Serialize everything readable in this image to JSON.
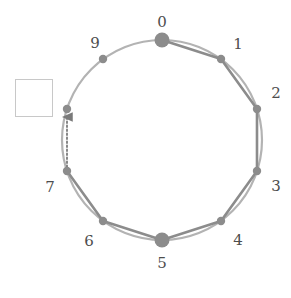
{
  "figure": {
    "kind": "cycle-graph-diagram",
    "width": 291,
    "height": 298,
    "background": "#ffffff"
  },
  "colors": {
    "circle_arc": "#b3b3b3",
    "polygon_edge": "#8c8c8c",
    "node_fill": "#8c8c8c",
    "label_text": "#4d4d4d",
    "box_border": "#c8c8c8",
    "box_fill": "#ffffff",
    "dotted_arrow": "#7a7a7a"
  },
  "circle": {
    "cx": 162,
    "cy": 140,
    "r": 100,
    "stroke_width": 2.2
  },
  "nodes": [
    {
      "id": "0",
      "label": "0",
      "angle_deg": -90,
      "x": 162,
      "y": 40,
      "radius": 7.5,
      "shape": "circle",
      "big": true,
      "label_x": 162,
      "label_y": 22,
      "label_anchor": "middle"
    },
    {
      "id": "1",
      "label": "1",
      "angle_deg": -54,
      "x": 221,
      "y": 59,
      "radius": 4.2,
      "shape": "circle",
      "big": false,
      "label_x": 238,
      "label_y": 44,
      "label_anchor": "middle"
    },
    {
      "id": "2",
      "label": "2",
      "angle_deg": -18,
      "x": 257,
      "y": 109,
      "radius": 4.2,
      "shape": "circle",
      "big": false,
      "label_x": 276,
      "label_y": 93,
      "label_anchor": "middle"
    },
    {
      "id": "3",
      "label": "3",
      "angle_deg": 18,
      "x": 257,
      "y": 171,
      "radius": 4.2,
      "shape": "circle",
      "big": false,
      "label_x": 276,
      "label_y": 186,
      "label_anchor": "middle"
    },
    {
      "id": "4",
      "label": "4",
      "angle_deg": 54,
      "x": 221,
      "y": 221,
      "radius": 4.2,
      "shape": "circle",
      "big": false,
      "label_x": 238,
      "label_y": 240,
      "label_anchor": "middle"
    },
    {
      "id": "5",
      "label": "5",
      "angle_deg": 90,
      "x": 162,
      "y": 240,
      "radius": 7.5,
      "shape": "circle",
      "big": true,
      "label_x": 162,
      "label_y": 263,
      "label_anchor": "middle"
    },
    {
      "id": "6",
      "label": "6",
      "angle_deg": 126,
      "x": 103,
      "y": 221,
      "radius": 4.2,
      "shape": "circle",
      "big": false,
      "label_x": 89,
      "label_y": 241,
      "label_anchor": "middle"
    },
    {
      "id": "7",
      "label": "7",
      "angle_deg": 162,
      "x": 67,
      "y": 171,
      "radius": 4.2,
      "shape": "circle",
      "big": false,
      "label_x": 50,
      "label_y": 187,
      "label_anchor": "middle"
    },
    {
      "id": "8",
      "label": "",
      "angle_deg": 198,
      "x": 67,
      "y": 109,
      "radius": 4.2,
      "shape": "circle",
      "big": false,
      "label_x": null,
      "label_y": null,
      "label_anchor": "middle"
    },
    {
      "id": "9",
      "label": "9",
      "angle_deg": 234,
      "x": 103,
      "y": 59,
      "radius": 4.2,
      "shape": "circle",
      "big": false,
      "label_x": 95,
      "label_y": 43,
      "label_anchor": "middle"
    }
  ],
  "polygon_edges": [
    {
      "from": "0",
      "to": "1"
    },
    {
      "from": "1",
      "to": "2"
    },
    {
      "from": "2",
      "to": "3"
    },
    {
      "from": "3",
      "to": "4"
    },
    {
      "from": "4",
      "to": "5"
    },
    {
      "from": "5",
      "to": "6"
    },
    {
      "from": "6",
      "to": "7"
    }
  ],
  "dotted_arrow": {
    "from": "7",
    "to": "8",
    "x1": 67,
    "y1": 167,
    "x2": 67,
    "y2": 117,
    "direction": "up",
    "style": "dotted"
  },
  "empty_box": {
    "x": 15,
    "y": 79,
    "width": 38,
    "height": 38,
    "label": ""
  }
}
